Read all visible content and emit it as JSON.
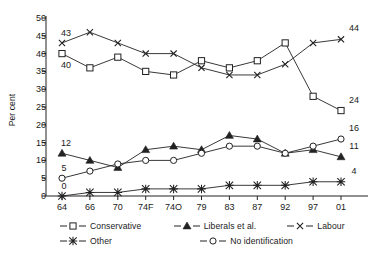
{
  "chart_data": {
    "type": "line",
    "title": "",
    "subtitle": "",
    "xlabel": "",
    "ylabel": "Per cent",
    "ylim": [
      0,
      50
    ],
    "ytick_step": 5,
    "yticks": [
      0,
      5,
      10,
      15,
      20,
      25,
      30,
      35,
      40,
      45,
      50
    ],
    "grid": false,
    "legend_position": "bottom",
    "categories": [
      "64",
      "66",
      "70",
      "74F",
      "74O",
      "79",
      "83",
      "87",
      "92",
      "97",
      "01"
    ],
    "series": [
      {
        "name": "Conservative",
        "marker": "open-square",
        "values": [
          40,
          36,
          39,
          35,
          34,
          38,
          36,
          38,
          43,
          28,
          24
        ],
        "start_label": "40",
        "end_label": "24"
      },
      {
        "name": "Liberals et al.",
        "marker": "filled-triangle",
        "values": [
          12,
          10,
          8,
          13,
          14,
          13,
          17,
          16,
          12,
          13,
          11
        ],
        "start_label": "12",
        "end_label": "11"
      },
      {
        "name": "Labour",
        "marker": "cross-x",
        "values": [
          43,
          46,
          43,
          40,
          40,
          36,
          34,
          34,
          37,
          43,
          44
        ],
        "start_label": "43",
        "end_label": "44"
      },
      {
        "name": "Other",
        "marker": "asterisk",
        "values": [
          0,
          1,
          1,
          2,
          2,
          2,
          3,
          3,
          3,
          4,
          4
        ],
        "start_label": "0",
        "end_label": "4"
      },
      {
        "name": "No identification",
        "marker": "open-circle",
        "values": [
          5,
          7,
          9,
          10,
          10,
          12,
          14,
          14,
          12,
          14,
          16
        ],
        "start_label": "5",
        "end_label": "16"
      }
    ],
    "annotations": {
      "left_labels": [
        {
          "text": "43",
          "series": "Labour",
          "value": 43
        },
        {
          "text": "40",
          "series": "Conservative",
          "value": 40
        },
        {
          "text": "12",
          "series": "Liberals et al.",
          "value": 12
        },
        {
          "text": "5",
          "series": "No identification",
          "value": 5
        },
        {
          "text": "0",
          "series": "Other",
          "value": 0
        }
      ],
      "right_labels": [
        {
          "text": "44",
          "series": "Labour",
          "value": 44
        },
        {
          "text": "24",
          "series": "Conservative",
          "value": 24
        },
        {
          "text": "16",
          "series": "No identification",
          "value": 16
        },
        {
          "text": "11",
          "series": "Liberals et al.",
          "value": 11
        },
        {
          "text": "4",
          "series": "Other",
          "value": 4
        }
      ]
    }
  },
  "legend": {
    "rows": [
      [
        {
          "label": "Conservative",
          "marker": "open-square"
        },
        {
          "label": "Liberals et al.",
          "marker": "filled-triangle"
        },
        {
          "label": "Labour",
          "marker": "cross-x"
        }
      ],
      [
        {
          "label": "Other",
          "marker": "asterisk"
        },
        {
          "label": "No identification",
          "marker": "open-circle"
        }
      ]
    ]
  },
  "colors": {
    "line": "#222222",
    "text": "#1a1a1a",
    "background": "#ffffff"
  }
}
